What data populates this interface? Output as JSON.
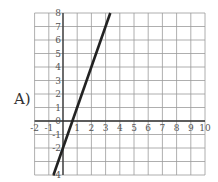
{
  "option_label": "A)",
  "chart_data": {
    "type": "line",
    "title": "",
    "xlabel": "",
    "ylabel": "",
    "xlim": [
      -2,
      10
    ],
    "ylim": [
      -4,
      8
    ],
    "grid": true,
    "x_ticks": [
      "-2",
      "-1",
      "1",
      "2",
      "3",
      "4",
      "5",
      "6",
      "7",
      "8",
      "9",
      "10"
    ],
    "y_ticks": [
      "8",
      "7",
      "6",
      "5",
      "4",
      "3",
      "2",
      "1",
      "0",
      "-1",
      "-2",
      "-4"
    ],
    "series": [
      {
        "name": "line",
        "equation": "y = 3x - 2",
        "x": [
          -0.67,
          3.33
        ],
        "y": [
          -4,
          8
        ]
      }
    ]
  }
}
